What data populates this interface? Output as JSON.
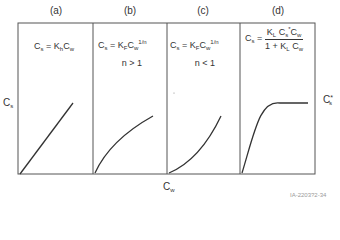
{
  "figure": {
    "panels": [
      {
        "id": "a",
        "label": "(a)",
        "model": "Linear",
        "equation": {
          "lhs": "C",
          "lhs_sub": "s",
          "rhs_parts": [
            "K",
            "h",
            "C",
            "w"
          ]
        },
        "condition": ""
      },
      {
        "id": "b",
        "label": "(b)",
        "model": "Freundlich",
        "equation": {
          "lhs": "C",
          "lhs_sub": "s",
          "rhs_parts": [
            "K",
            "F",
            "C",
            "w"
          ],
          "exponent": "1/n"
        },
        "condition": "n > 1"
      },
      {
        "id": "c",
        "label": "(c)",
        "model": "Freundlich",
        "equation": {
          "lhs": "C",
          "lhs_sub": "s",
          "rhs_parts": [
            "K",
            "F",
            "C",
            "w"
          ],
          "exponent": "1/n"
        },
        "condition": "n < 1"
      },
      {
        "id": "d",
        "label": "(d)",
        "model": "Langmuir",
        "equation": {
          "lhs": "C",
          "lhs_sub": "s",
          "numerator": "K_L C_s* C_w",
          "denominator": "1 + K_L C_w"
        },
        "condition": ""
      }
    ],
    "axes": {
      "y_label": {
        "main": "C",
        "sub": "s"
      },
      "x_label": {
        "main": "C",
        "sub": "w"
      },
      "asymptote_label": {
        "main": "C",
        "sub": "s",
        "sup": "*"
      }
    },
    "figure_code": "IA-2203?2-34",
    "colors": {
      "line": "#333333",
      "frame": "#555555"
    }
  }
}
